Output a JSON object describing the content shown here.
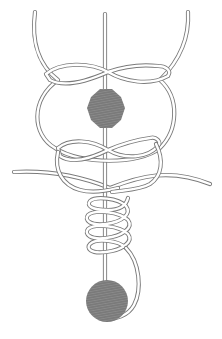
{
  "diagram": {
    "type": "knot-diagram",
    "colors": {
      "background": "#ffffff",
      "line": "#7a7a7a",
      "bead_fill": "#777777",
      "bead_hatch": "#8c8c8c"
    },
    "elements": [
      {
        "name": "main-line",
        "kind": "vertical-line"
      },
      {
        "name": "upper-loop",
        "kind": "loop"
      },
      {
        "name": "upper-crossing",
        "kind": "figure-eight-wrap"
      },
      {
        "name": "upper-bead",
        "kind": "bead",
        "shape": "octagon"
      },
      {
        "name": "lower-crossing",
        "kind": "figure-eight-wrap"
      },
      {
        "name": "horizontal-line",
        "kind": "line"
      },
      {
        "name": "coil",
        "kind": "helix",
        "turns": 4
      },
      {
        "name": "lower-bead",
        "kind": "bead",
        "shape": "circle"
      },
      {
        "name": "tag-end",
        "kind": "curve"
      }
    ]
  }
}
